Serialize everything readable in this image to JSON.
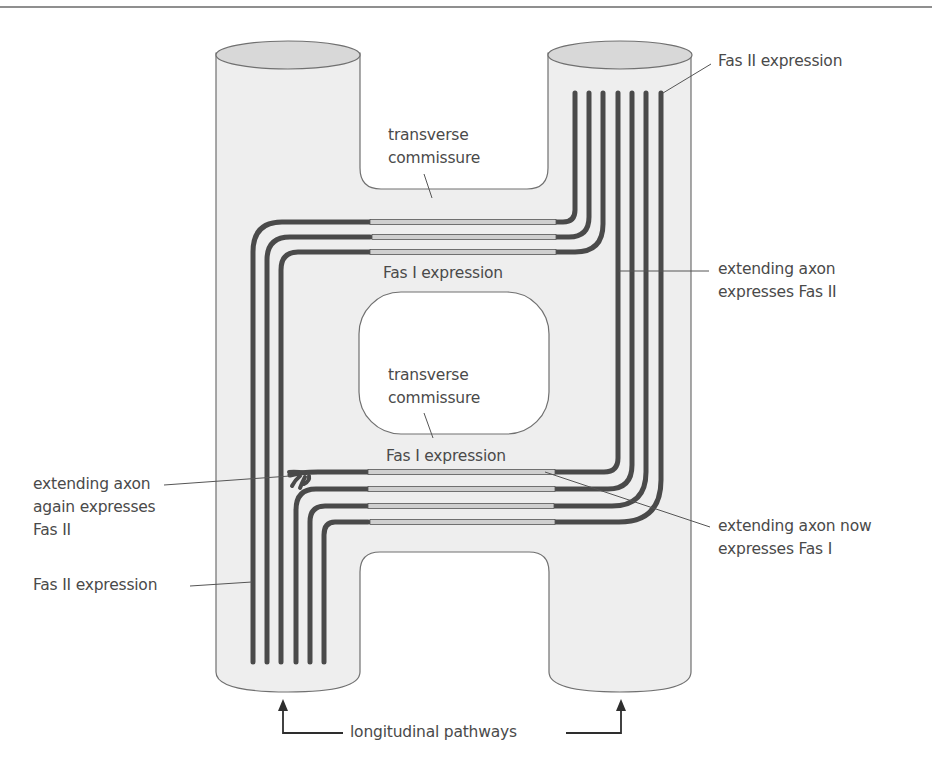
{
  "diagram": {
    "labels": {
      "fas2_top_right": "Fas II expression",
      "transverse_commissure_upper_1": "transverse",
      "transverse_commissure_upper_2": "commissure",
      "fas1_upper": "Fas I expression",
      "extending_axon_fas2_right_1": "extending axon",
      "extending_axon_fas2_right_2": "expresses Fas II",
      "transverse_commissure_lower_1": "transverse",
      "transverse_commissure_lower_2": "commissure",
      "fas1_lower": "Fas I expression",
      "extending_axon_again_1": "extending axon",
      "extending_axon_again_2": "again expresses",
      "extending_axon_again_3": "Fas II",
      "extending_axon_now_1": "extending axon now",
      "extending_axon_now_2": "expresses Fas I",
      "fas2_left": "Fas II expression",
      "longitudinal_pathways": "longitudinal pathways"
    },
    "structures": {
      "left_longitudinal_pathway": "left column",
      "right_longitudinal_pathway": "right column",
      "upper_transverse_commissure": "upper commissure",
      "lower_transverse_commissure": "lower commissure"
    },
    "axon_counts": {
      "upper_commissure_axons": 3,
      "lower_commissure_axons": 4,
      "right_pathway_axons_top": 7,
      "left_pathway_axons_bottom": 6
    },
    "colors": {
      "tissue_fill": "#eeeeee",
      "tissue_cap": "#d6d6d6",
      "outline": "#6e6e6e",
      "fas2_axon": "#4a4a4a",
      "fas1_segment": "#cfcfcf",
      "text": "#4a4a4a"
    }
  }
}
